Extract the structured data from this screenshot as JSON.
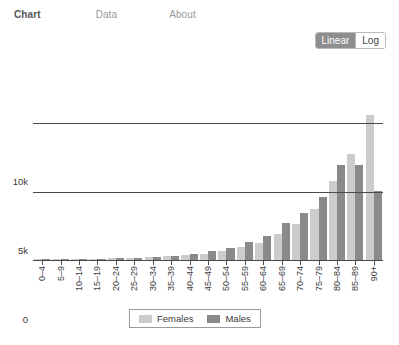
{
  "nav": {
    "items": [
      {
        "label": "Chart",
        "active": true
      },
      {
        "label": "Data",
        "active": false
      },
      {
        "label": "About",
        "active": false
      }
    ]
  },
  "scale_toggle": {
    "name": "y-axis-scale",
    "options": [
      {
        "label": "Linear",
        "selected": true
      },
      {
        "label": "Log",
        "selected": false
      }
    ],
    "selected": "Linear",
    "active_bg": "#8e8e8e",
    "inactive_bg": "#ffffff"
  },
  "legend": {
    "position": "bottom-center",
    "entries": [
      {
        "label": "Females",
        "color": "#cccccc"
      },
      {
        "label": "Males",
        "color": "#8a8a8a"
      }
    ]
  },
  "chart_data": {
    "type": "bar",
    "title": "",
    "subtitle": "",
    "xlabel": "",
    "ylabel": "",
    "grid": true,
    "legend_position": "bottom-center",
    "scale": "linear",
    "ylim": [
      0,
      14500
    ],
    "yticks": [
      0,
      5000,
      10000
    ],
    "ytick_labels": [
      "0",
      "5k",
      "10k"
    ],
    "categories": [
      "0–4",
      "5–9",
      "10–14",
      "15–19",
      "20–24",
      "25–29",
      "30–34",
      "35–39",
      "40–44",
      "45–49",
      "50–54",
      "55–59",
      "60–64",
      "65–69",
      "70–74",
      "75–79",
      "80–84",
      "85–89",
      "90+"
    ],
    "series": [
      {
        "name": "Females",
        "color": "#cccccc",
        "values": [
          60,
          60,
          75,
          90,
          110,
          150,
          190,
          260,
          340,
          450,
          680,
          950,
          1250,
          1900,
          2600,
          3700,
          5700,
          7700,
          10500
        ]
      },
      {
        "name": "Males",
        "color": "#8a8a8a",
        "values": [
          70,
          70,
          85,
          100,
          130,
          180,
          230,
          320,
          430,
          620,
          900,
          1300,
          1750,
          2700,
          3400,
          4600,
          6900,
          6900,
          5000
        ]
      }
    ]
  }
}
